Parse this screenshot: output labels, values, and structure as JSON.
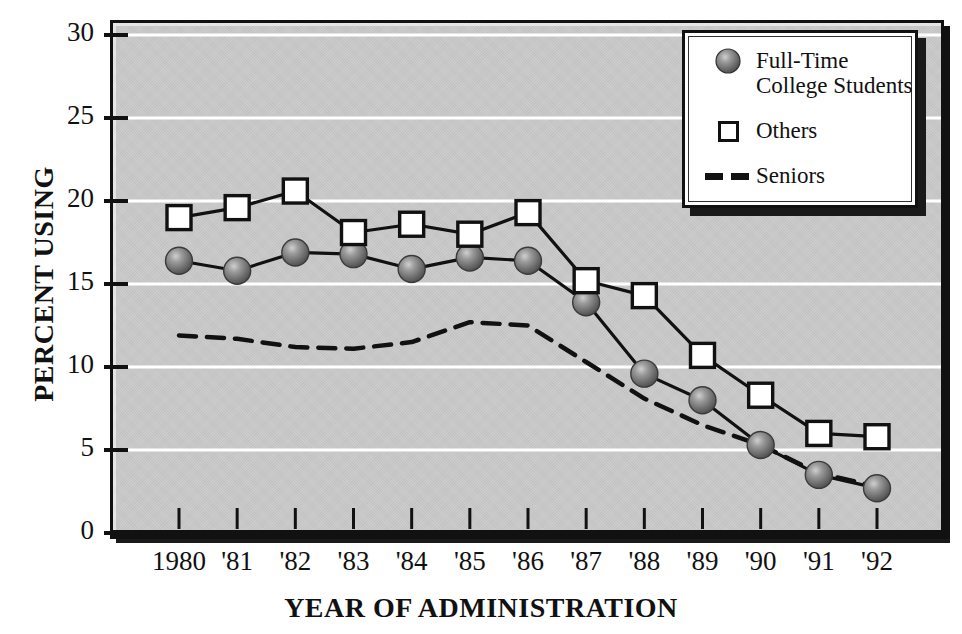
{
  "chart_data": {
    "type": "line",
    "title": "",
    "xlabel": "YEAR OF ADMINISTRATION",
    "ylabel": "PERCENT USING",
    "categories": [
      "1980",
      "'81",
      "'82",
      "'83",
      "'84",
      "'85",
      "'86",
      "'87",
      "'88",
      "'89",
      "'90",
      "'91",
      "'92"
    ],
    "x_values": [
      1980,
      1981,
      1982,
      1983,
      1984,
      1985,
      1986,
      1987,
      1988,
      1989,
      1990,
      1991,
      1992
    ],
    "ylim": [
      0,
      30
    ],
    "y_ticks": [
      "0",
      "5",
      "10",
      "15",
      "20",
      "25",
      "30"
    ],
    "y_tick_values": [
      0,
      5,
      10,
      15,
      20,
      25,
      30
    ],
    "grid": "horizontal-white",
    "legend_position": "top-right",
    "series": [
      {
        "name": "Full-Time\nCollege Students",
        "marker": "filled-sphere",
        "line": "solid",
        "color": "#6b6b6b",
        "values": [
          16.4,
          15.8,
          16.9,
          16.8,
          15.9,
          16.6,
          16.4,
          13.9,
          9.6,
          8.0,
          5.3,
          3.5,
          2.7
        ]
      },
      {
        "name": "Others",
        "marker": "open-square",
        "line": "solid",
        "color": "#ffffff",
        "values": [
          19.0,
          19.6,
          20.6,
          18.1,
          18.6,
          18.0,
          19.3,
          15.2,
          14.3,
          10.7,
          8.3,
          6.0,
          5.8
        ]
      },
      {
        "name": "Seniors",
        "marker": "none",
        "line": "dashed",
        "color": "#111111",
        "values": [
          11.9,
          11.7,
          11.2,
          11.1,
          11.5,
          12.7,
          12.5,
          10.3,
          8.1,
          6.5,
          5.3,
          3.6,
          2.8
        ]
      }
    ]
  },
  "axes": {
    "y_label": "PERCENT USING",
    "x_label": "YEAR OF ADMINISTRATION",
    "y_ticks": [
      "30",
      "25",
      "20",
      "15",
      "10",
      "5",
      "0"
    ],
    "x_ticks": [
      "1980",
      "'81",
      "'82",
      "'83",
      "'84",
      "'85",
      "'86",
      "'87",
      "'88",
      "'89",
      "'90",
      "'91",
      "'92"
    ]
  },
  "legend": {
    "items": [
      {
        "label": "Full-Time\nCollege Students",
        "swatch": "sphere-marker-icon"
      },
      {
        "label": "Others",
        "swatch": "open-square-marker-icon"
      },
      {
        "label": "Seniors",
        "swatch": "dashed-line-icon"
      }
    ]
  },
  "colors": {
    "panel": "#c9c9c9",
    "frame": "#111111",
    "gridline": "#ffffff",
    "sphere": "#6b6b6b",
    "square_fill": "#ffffff",
    "text": "#111111"
  }
}
